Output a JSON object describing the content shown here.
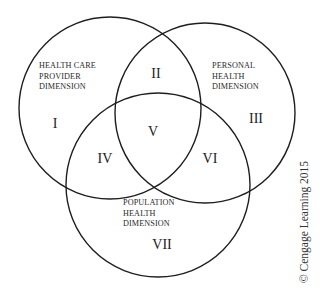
{
  "diagram": {
    "type": "venn",
    "circles": [
      {
        "id": "health_care_provider",
        "label_lines": [
          "HEALTH CARE",
          "PROVIDER",
          "DIMENSION"
        ],
        "cx": 110,
        "cy": 108,
        "r": 91
      },
      {
        "id": "personal_health",
        "label_lines": [
          "PERSONAL",
          "HEALTH",
          "DIMENSION"
        ],
        "cx": 205,
        "cy": 113,
        "r": 90
      },
      {
        "id": "population_health",
        "label_lines": [
          "POPULATION",
          "HEALTH",
          "DIMENSION"
        ],
        "cx": 158,
        "cy": 185,
        "r": 92
      }
    ],
    "regions": [
      {
        "numeral": "I",
        "description": "Health Care Provider only"
      },
      {
        "numeral": "II",
        "description": "Health Care Provider ∩ Personal Health"
      },
      {
        "numeral": "III",
        "description": "Personal Health only"
      },
      {
        "numeral": "IV",
        "description": "Health Care Provider ∩ Population Health"
      },
      {
        "numeral": "V",
        "description": "All three dimensions"
      },
      {
        "numeral": "VI",
        "description": "Personal Health ∩ Population Health"
      },
      {
        "numeral": "VII",
        "description": "Population Health only"
      }
    ],
    "stroke_color": "#1e1e1e",
    "background_color": "#ffffff"
  },
  "copyright": "© Cengage Learning 2015"
}
